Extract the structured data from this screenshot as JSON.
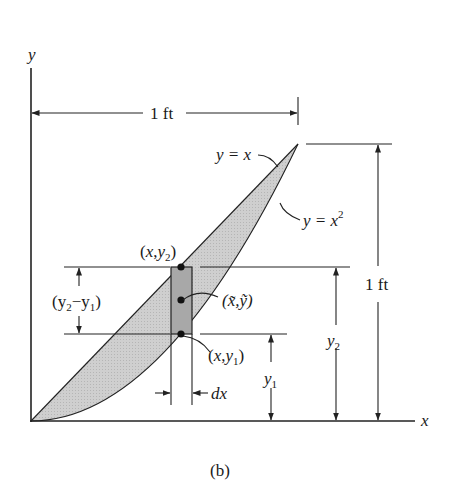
{
  "figure": {
    "caption": "(b)",
    "axes": {
      "x_label": "x",
      "y_label": "y"
    },
    "curves": [
      {
        "equation_label": "y = x",
        "type": "line"
      },
      {
        "equation_label": "y = x",
        "superscript": "2",
        "type": "parabola"
      }
    ],
    "dimensions": {
      "width": "1 ft",
      "height": "1 ft",
      "strip_height": "(y2−y1)",
      "y2": "y",
      "y2_sub": "2",
      "y1": "y",
      "y1_sub": "1",
      "dx": "dx"
    },
    "points": {
      "top": {
        "pre": "(x,y",
        "sub": "2",
        "post": ")"
      },
      "centroid": "(x̃,ỹ)",
      "bottom": {
        "pre": "(x,y",
        "sub": "1",
        "post": ")"
      }
    },
    "strip_label_parts": {
      "open": "(y",
      "sub2": "2",
      "minus": "−y",
      "sub1": "1",
      "close": ")"
    },
    "colors": {
      "shade": "#c8c8c8",
      "strip": "#a9a9a9",
      "ink": "#222222"
    }
  }
}
